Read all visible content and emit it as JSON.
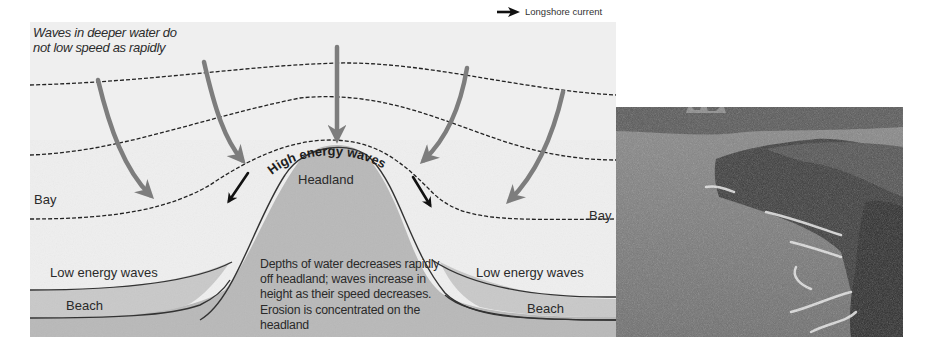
{
  "diagram": {
    "caption_line1": "Waves in deeper water do",
    "caption_line2": "not low speed as rapidly",
    "legend": {
      "icon": "black-arrow-right-icon",
      "label": "Longshore current"
    },
    "labels": {
      "high_energy": "High energy waves",
      "headland": "Headland",
      "bay_left": "Bay",
      "bay_right": "Bay",
      "low_energy_left": "Low energy waves",
      "low_energy_right": "Low energy waves",
      "beach_left": "Beach",
      "beach_right": "Beach"
    },
    "explanation": "Depths of water decreases rapidly off headland; waves increase in height as their speed decreases. Erosion is concentrated on the headland",
    "colors": {
      "background": "#efefef",
      "land": "#b9b9b9",
      "wave_arrow": "#7d7d7d",
      "current_arrow": "#111111",
      "line": "#333333"
    }
  },
  "photo": {
    "subject": "coastal-headland-photo",
    "description": "Grayscale photograph of a rocky headland cliff jutting into the sea with breaking white surf and a city skyline on the distant horizon"
  }
}
